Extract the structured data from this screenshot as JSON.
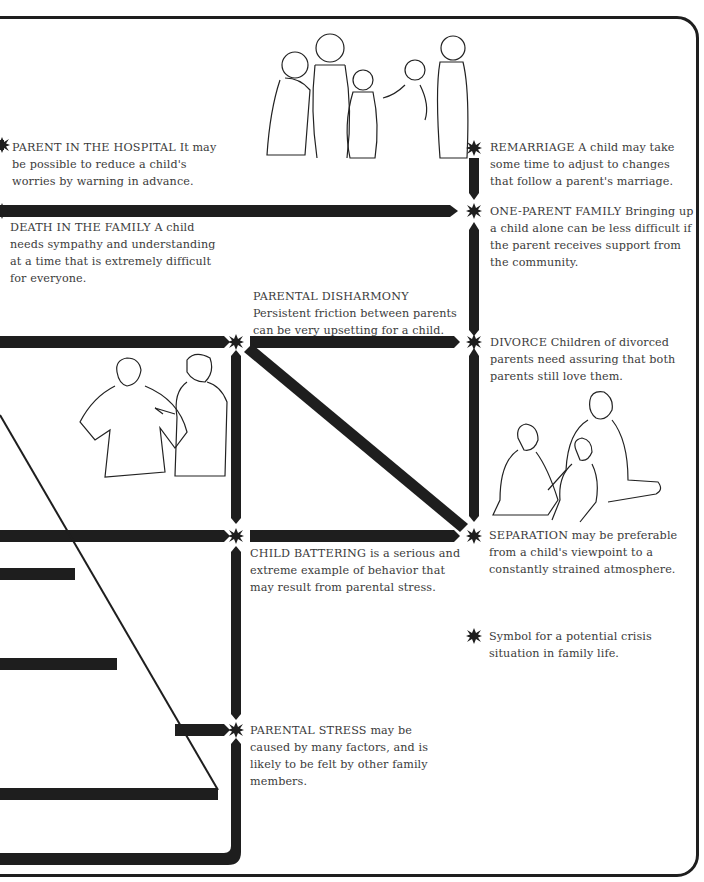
{
  "diagram": {
    "type": "family crisis flow diagram",
    "colors": {
      "line": "#1e1e1e",
      "text": "#3b3b3b",
      "background": "#ffffff"
    },
    "legend": {
      "symbol": "crisis-star-icon",
      "text": "Symbol for a potential crisis situation in family life."
    },
    "nodes": [
      {
        "id": "parent-in-hospital",
        "heading": "PARENT IN THE HOSPITAL",
        "text": " It may be possible to reduce a child's worries by warning in advance."
      },
      {
        "id": "death-in-family",
        "heading": "DEATH IN THE FAMILY",
        "text": " A child needs sympathy and understanding at a time that is extremely difficult for everyone."
      },
      {
        "id": "remarriage",
        "heading": "REMARRIAGE",
        "text": " A child may take some time to adjust to changes that follow a parent's marriage."
      },
      {
        "id": "one-parent-family",
        "heading": "ONE-PARENT FAMILY",
        "text": " Bringing up a child alone can be less difficult if the parent receives support from the community."
      },
      {
        "id": "parental-disharmony",
        "heading": "PARENTAL DISHARMONY",
        "text": "Persistent friction between parents can be very upsetting for a child."
      },
      {
        "id": "divorce",
        "heading": "DIVORCE",
        "text": " Children of divorced parents need assuring that both parents still love them."
      },
      {
        "id": "separation",
        "heading": "SEPARATION",
        "text": " may be preferable from a child's viewpoint to a constantly strained atmosphere."
      },
      {
        "id": "child-battering",
        "heading": "CHILD BATTERING",
        "text": " is a serious and extreme example of behavior that may result from parental stress."
      },
      {
        "id": "parental-stress",
        "heading": "PARENTAL STRESS",
        "text": " may be caused by many factors, and is likely to be felt by other family members."
      }
    ],
    "illustrations": [
      {
        "id": "family-group",
        "description": "line drawing of a family group: two children, a mother, a girl and a father holding a baby"
      },
      {
        "id": "arguing-parents",
        "description": "line drawing of two adults arguing, one pointing"
      },
      {
        "id": "mother-children",
        "description": "line drawing of a mother seated with a baby and a girl kneeling"
      }
    ]
  }
}
